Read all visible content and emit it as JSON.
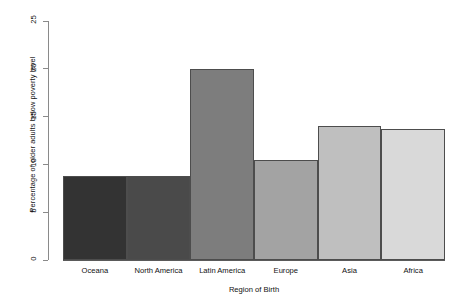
{
  "chart_data": {
    "type": "bar",
    "title": "",
    "xlabel": "Region of Birth",
    "ylabel": "Percentage of older adults below poverty level",
    "categories": [
      "Oceana",
      "North America",
      "Latin America",
      "Europe",
      "Asia",
      "Africa"
    ],
    "values": [
      8.8,
      8.8,
      20.0,
      10.5,
      14.0,
      13.7
    ],
    "bar_colors": [
      "#333333",
      "#4a4a4a",
      "#7d7d7d",
      "#a3a3a3",
      "#bfbfbf",
      "#d9d9d9"
    ],
    "bar_border_color": "#4d4d4d",
    "ylim": [
      0,
      25
    ],
    "yticks": [
      0,
      5,
      10,
      15,
      20,
      25
    ],
    "ytick_labels": [
      "0",
      "5",
      "10",
      "15",
      "20",
      "25"
    ],
    "grid": false,
    "legend": "none",
    "axis_color": "#8a8a8a"
  },
  "axes": {
    "y_title": "Percentage of older adults below poverty level",
    "x_title": "Region of Birth"
  }
}
